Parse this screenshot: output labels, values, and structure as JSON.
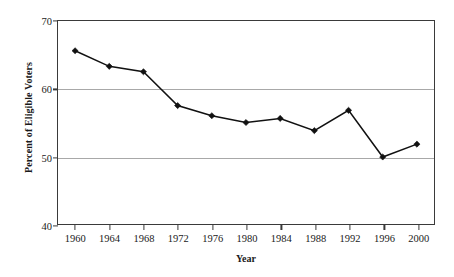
{
  "chart_data": {
    "type": "line",
    "title": "",
    "xlabel": "Year",
    "ylabel": "Percent of Eligible Voters",
    "categories": [
      "1960",
      "1964",
      "1968",
      "1972",
      "1976",
      "1980",
      "1984",
      "1988",
      "1992",
      "1996",
      "2000"
    ],
    "x": [
      1960,
      1964,
      1968,
      1972,
      1976,
      1980,
      1984,
      1988,
      1992,
      1996,
      2000
    ],
    "values": [
      65.6,
      63.3,
      62.5,
      57.5,
      56.0,
      55.0,
      55.6,
      53.8,
      56.8,
      49.9,
      51.8
    ],
    "series": [
      {
        "name": "Percent of Eligible Voters",
        "values": [
          65.6,
          63.3,
          62.5,
          57.5,
          56.0,
          55.0,
          55.6,
          53.8,
          56.8,
          49.9,
          51.8
        ]
      }
    ],
    "xlim": [
      1958,
      2002
    ],
    "ylim": [
      40,
      70
    ],
    "yticks": [
      40,
      50,
      60,
      70
    ],
    "ytick_labels": [
      "40",
      "50",
      "60",
      "70"
    ],
    "xticks": [
      1960,
      1964,
      1968,
      1972,
      1976,
      1980,
      1984,
      1988,
      1992,
      1996,
      2000
    ],
    "grid": true,
    "grid_axis": "y",
    "grid_values": [
      50,
      60
    ],
    "legend": false,
    "legend_position": "none",
    "marker": "diamond",
    "line_color": "#111111",
    "marker_color": "#111111",
    "grid_color": "#a8a8a8",
    "frame_color": "#3a3a3a",
    "background_color": "#ffffff",
    "annotations": []
  }
}
